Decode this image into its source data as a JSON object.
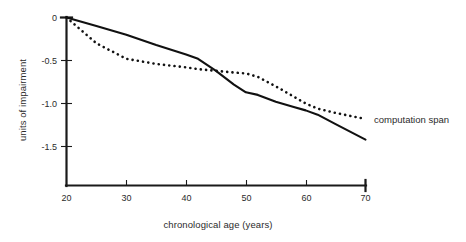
{
  "chart_data": {
    "type": "line",
    "title": "",
    "xlabel": "chronological age (years)",
    "ylabel": "units of impairment",
    "xlim": [
      20,
      70
    ],
    "ylim": [
      -1.6,
      0.05
    ],
    "grid": false,
    "legend_position": "right-inline-annotation",
    "xticks": [
      20,
      30,
      40,
      50,
      60,
      70
    ],
    "xtick_labels": [
      "20",
      "30",
      "40",
      "50",
      "60",
      "70"
    ],
    "yticks": [
      0,
      -0.5,
      -1.0,
      -1.5
    ],
    "ytick_labels": [
      "0",
      "-0.5",
      "-1.0",
      "-1.5"
    ],
    "x": [
      20,
      25,
      30,
      35,
      40,
      42,
      45,
      48,
      50,
      52,
      55,
      58,
      60,
      62,
      65,
      70
    ],
    "series": [
      {
        "name": "unlabeled-solid-series",
        "style": "solid",
        "label": "",
        "values": [
          0.0,
          -0.1,
          -0.2,
          -0.32,
          -0.43,
          -0.48,
          -0.62,
          -0.78,
          -0.87,
          -0.9,
          -0.98,
          -1.04,
          -1.08,
          -1.13,
          -1.24,
          -1.42
        ]
      },
      {
        "name": "computation span",
        "style": "dotted",
        "label": "computation span",
        "values": [
          0.0,
          -0.3,
          -0.48,
          -0.54,
          -0.58,
          -0.6,
          -0.62,
          -0.64,
          -0.65,
          -0.69,
          -0.8,
          -0.92,
          -1.0,
          -1.06,
          -1.11,
          -1.18
        ]
      }
    ],
    "annotations": [
      {
        "text": "computation span",
        "x": 70,
        "y": -1.18,
        "align": "left"
      }
    ],
    "colors": {
      "ink": "#111111",
      "axis": "#1a1a1a",
      "background": "#ffffff"
    }
  },
  "figure": {
    "caption": ""
  }
}
